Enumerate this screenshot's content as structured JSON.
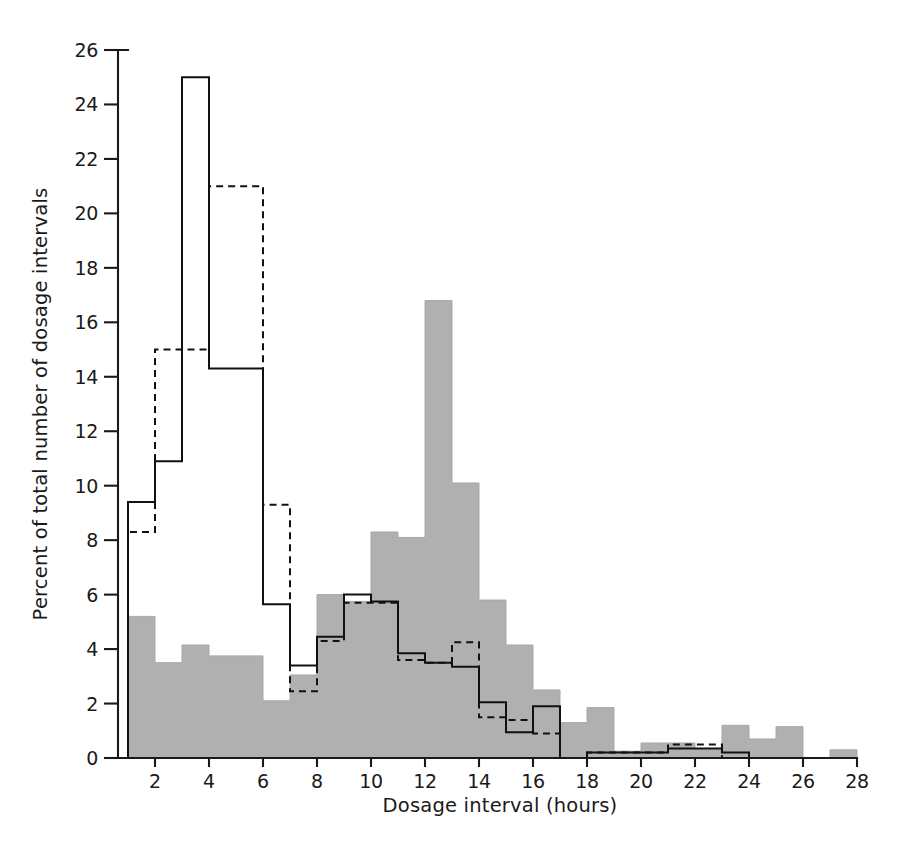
{
  "chart_data": {
    "type": "bar",
    "title": "",
    "subtitle": "",
    "xlabel": "Dosage interval (hours)",
    "ylabel": "Percent of total number of dosage intervals",
    "xlim": [
      1,
      28
    ],
    "ylim": [
      0,
      26
    ],
    "xticks": [
      2,
      4,
      6,
      8,
      10,
      12,
      14,
      16,
      18,
      20,
      22,
      24,
      26,
      28
    ],
    "xtick_labels": [
      "2",
      "4",
      "6",
      "8",
      "10",
      "12",
      "14",
      "16",
      "18",
      "20",
      "22",
      "24",
      "26",
      "28"
    ],
    "yticks": [
      0,
      2,
      4,
      6,
      8,
      10,
      12,
      14,
      16,
      18,
      20,
      22,
      24,
      26
    ],
    "ytick_labels": [
      "0",
      "2",
      "4",
      "6",
      "8",
      "10",
      "12",
      "14",
      "16",
      "18",
      "20",
      "22",
      "24",
      "26"
    ],
    "grid": false,
    "legend": "none",
    "bin_edges": [
      1,
      2,
      3,
      4,
      5,
      6,
      7,
      8,
      9,
      10,
      11,
      12,
      13,
      14,
      15,
      16,
      17,
      18,
      19,
      20,
      21,
      22,
      23,
      24,
      25,
      26,
      27,
      28
    ],
    "bin_centers": [
      1.5,
      2.5,
      3.5,
      4.5,
      5.5,
      6.5,
      7.5,
      8.5,
      9.5,
      10.5,
      11.5,
      12.5,
      13.5,
      14.5,
      15.5,
      16.5,
      17.5,
      18.5,
      19.5,
      20.5,
      21.5,
      22.5,
      23.5,
      24.5,
      25.5,
      26.5,
      27.5
    ],
    "series": [
      {
        "name": "shaded-histogram",
        "style": "filled",
        "color": "#b0b0b0",
        "values": [
          5.2,
          3.5,
          4.15,
          3.75,
          3.75,
          2.1,
          3.05,
          6.0,
          5.75,
          8.3,
          8.1,
          16.8,
          10.1,
          5.8,
          4.15,
          2.5,
          1.3,
          1.85,
          0.25,
          0.55,
          0.55,
          0.3,
          1.2,
          0.7,
          1.15,
          0.0,
          0.3
        ]
      },
      {
        "name": "solid-line-histogram",
        "style": "solid",
        "color": "#111111",
        "values": [
          9.4,
          10.9,
          25.0,
          14.3,
          14.3,
          5.65,
          3.4,
          4.45,
          6.0,
          5.75,
          3.85,
          3.5,
          3.35,
          2.05,
          0.95,
          1.9,
          0.0,
          0.2,
          0.2,
          0.2,
          0.35,
          0.35,
          0.2,
          0.0,
          0.0,
          0.0,
          0.0
        ]
      },
      {
        "name": "dashed-line-histogram",
        "style": "dashed",
        "color": "#111111",
        "values": [
          8.3,
          15.0,
          15.0,
          21.0,
          21.0,
          9.3,
          2.45,
          4.3,
          5.7,
          5.7,
          3.6,
          3.5,
          4.25,
          1.5,
          1.4,
          0.9,
          0.0,
          0.2,
          0.2,
          0.2,
          0.5,
          0.5,
          0.0,
          0.0,
          0.0,
          0.0,
          0.0
        ]
      }
    ]
  },
  "figure": {
    "background_color": "#ffffff",
    "axis_color": "#1a1a1a",
    "shade_color": "#b0b0b0"
  }
}
